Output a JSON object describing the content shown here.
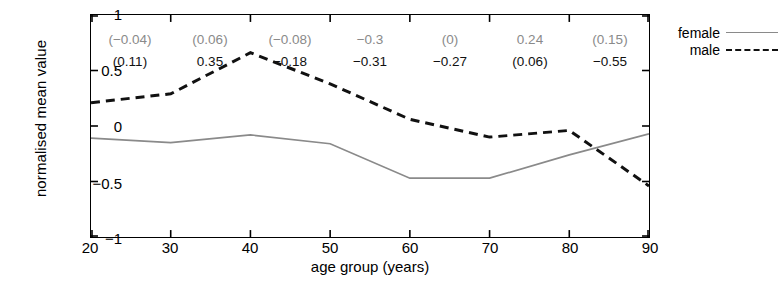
{
  "chart_data": {
    "type": "line",
    "title": "",
    "xlabel": "age group (years)",
    "ylabel": "normalised mean value",
    "xlim": [
      20,
      90
    ],
    "ylim": [
      -1,
      1
    ],
    "xticks": [
      "20",
      "30",
      "40",
      "50",
      "60",
      "70",
      "80",
      "90"
    ],
    "yticks": [
      "1",
      "0.5",
      "0",
      "-0.5",
      "-1"
    ],
    "ytick_labels_display": [
      "1",
      "0.5",
      "0",
      "−0.5",
      "−1"
    ],
    "grid": false,
    "legend_position": "right-outside-top",
    "x": [
      20,
      30,
      40,
      50,
      60,
      70,
      80,
      90
    ],
    "series": [
      {
        "name": "female",
        "style": "solid",
        "color": "#8a8a8a",
        "values": [
          -0.11,
          -0.15,
          -0.08,
          -0.16,
          -0.47,
          -0.47,
          -0.26,
          -0.07
        ]
      },
      {
        "name": "male",
        "style": "dashed",
        "color": "#111111",
        "values": [
          0.21,
          0.29,
          0.66,
          0.38,
          0.06,
          -0.1,
          -0.04,
          -0.54
        ]
      }
    ],
    "annotations": {
      "categories": [
        "20-30",
        "30-40",
        "40-50",
        "50-60",
        "60-70",
        "70-80",
        "80-90"
      ],
      "centers": [
        25,
        35,
        45,
        55,
        65,
        75,
        85
      ],
      "female_row": [
        "(−0.04)",
        "(0.06)",
        "(−0.08)",
        "−0.3",
        "(0)",
        "0.24",
        "(0.15)"
      ],
      "male_row": [
        "(0.11)",
        "0.35",
        "−0.18",
        "−0.31",
        "−0.27",
        "(0.06)",
        "−0.55"
      ]
    }
  },
  "legend": {
    "entries": [
      {
        "label": "female",
        "style": "solid"
      },
      {
        "label": "male",
        "style": "dashed"
      }
    ]
  }
}
